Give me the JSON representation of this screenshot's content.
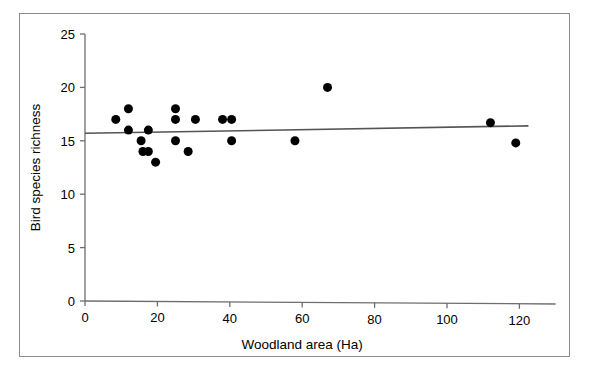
{
  "page": {
    "top_cutoff_text": "",
    "caption": ""
  },
  "chart_data": {
    "type": "scatter",
    "title": "",
    "xlabel": "Woodland area (Ha)",
    "ylabel": "Bird species richness",
    "xlim": [
      0,
      130
    ],
    "ylim": [
      0,
      25
    ],
    "xticks": [
      0,
      20,
      40,
      60,
      80,
      100,
      120
    ],
    "yticks": [
      0,
      5,
      10,
      15,
      20,
      25
    ],
    "xtick_labels": [
      "0",
      "20",
      "40",
      "60",
      "80",
      "100",
      "120"
    ],
    "ytick_labels": [
      "0",
      "5",
      "10",
      "15",
      "20",
      "25"
    ],
    "grid": false,
    "legend": null,
    "marker": {
      "shape": "circle",
      "color": "#000000",
      "size_px": 9
    },
    "points": [
      {
        "x": 8.5,
        "y": 17.0
      },
      {
        "x": 12.0,
        "y": 18.0
      },
      {
        "x": 12.0,
        "y": 16.0
      },
      {
        "x": 15.5,
        "y": 15.0
      },
      {
        "x": 16.0,
        "y": 14.0
      },
      {
        "x": 17.5,
        "y": 14.0
      },
      {
        "x": 17.5,
        "y": 16.0
      },
      {
        "x": 19.5,
        "y": 13.0
      },
      {
        "x": 25.0,
        "y": 18.0
      },
      {
        "x": 25.0,
        "y": 17.0
      },
      {
        "x": 25.0,
        "y": 15.0
      },
      {
        "x": 28.5,
        "y": 14.0
      },
      {
        "x": 30.5,
        "y": 17.0
      },
      {
        "x": 38.0,
        "y": 17.0
      },
      {
        "x": 40.5,
        "y": 17.0
      },
      {
        "x": 40.5,
        "y": 15.0
      },
      {
        "x": 58.0,
        "y": 15.0
      },
      {
        "x": 67.0,
        "y": 20.0
      },
      {
        "x": 112.0,
        "y": 16.7
      },
      {
        "x": 119.0,
        "y": 14.8
      }
    ],
    "trendline": {
      "type": "linear",
      "color": "#555555",
      "x_start": 0,
      "y_start": 15.7,
      "x_end": 122.5,
      "y_end": 16.4
    }
  },
  "axes": {
    "line_color": "#6e6e6e",
    "x_axis_overshoot": 130,
    "y_axis_top": 25
  }
}
